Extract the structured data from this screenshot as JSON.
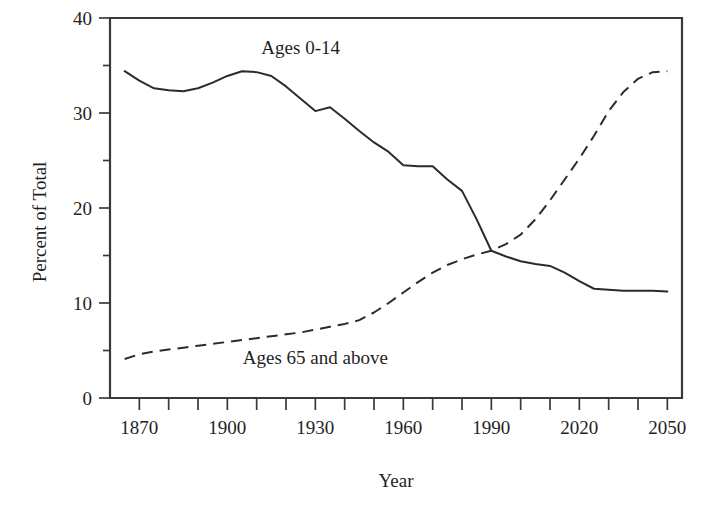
{
  "chart_data": {
    "type": "line",
    "title": "",
    "xlabel": "Year",
    "ylabel": "Percent of Total",
    "xlim": [
      1860,
      2055
    ],
    "ylim": [
      0,
      40
    ],
    "grid": false,
    "legend_position": "inline-annotations",
    "y_tick_labels": [
      "0",
      "10",
      "20",
      "30",
      "40"
    ],
    "y_tick_values": [
      0,
      10,
      20,
      30,
      40
    ],
    "y_minor_tick_values": [
      5,
      15,
      25,
      35
    ],
    "x_tick_labels": [
      "1870",
      "1900",
      "1930",
      "1960",
      "1990",
      "2020",
      "2050"
    ],
    "x_tick_values": [
      1870,
      1900,
      1930,
      1960,
      1990,
      2020,
      2050
    ],
    "x_minor_tick_values": [
      1880,
      1890,
      1910,
      1920,
      1940,
      1950,
      1970,
      1980,
      2000,
      2010,
      2030,
      2040
    ],
    "series": [
      {
        "name": "Ages 0-14",
        "style": "solid",
        "color": "#2b2b2b",
        "annotation": "Ages 0-14",
        "annotation_x": 1925,
        "annotation_y": 36.2,
        "x": [
          1865,
          1870,
          1875,
          1880,
          1885,
          1890,
          1895,
          1900,
          1905,
          1910,
          1915,
          1920,
          1925,
          1930,
          1935,
          1940,
          1945,
          1950,
          1955,
          1960,
          1965,
          1970,
          1975,
          1980,
          1985,
          1990,
          1995,
          2000,
          2005,
          2010,
          2015,
          2020,
          2025,
          2030,
          2035,
          2040,
          2045,
          2050
        ],
        "y": [
          34.4,
          33.4,
          32.6,
          32.4,
          32.3,
          32.6,
          33.2,
          33.9,
          34.4,
          34.3,
          33.9,
          32.8,
          31.5,
          30.2,
          30.6,
          29.4,
          28.1,
          26.9,
          25.9,
          24.5,
          24.4,
          24.4,
          23.0,
          21.8,
          18.8,
          15.5,
          14.9,
          14.4,
          14.1,
          13.9,
          13.2,
          12.3,
          11.5,
          11.4,
          11.3,
          11.3,
          11.3,
          11.2
        ]
      },
      {
        "name": "Ages 65 and above",
        "style": "dashed",
        "color": "#2b2b2b",
        "annotation": "Ages 65 and above",
        "annotation_x": 1930,
        "annotation_y": 3.6,
        "x": [
          1865,
          1870,
          1875,
          1880,
          1885,
          1890,
          1895,
          1900,
          1905,
          1910,
          1915,
          1920,
          1925,
          1930,
          1935,
          1940,
          1945,
          1950,
          1955,
          1960,
          1965,
          1970,
          1975,
          1980,
          1985,
          1990,
          1995,
          2000,
          2005,
          2010,
          2015,
          2020,
          2025,
          2030,
          2035,
          2040,
          2045,
          2050
        ],
        "y": [
          4.1,
          4.6,
          4.9,
          5.1,
          5.3,
          5.5,
          5.7,
          5.9,
          6.1,
          6.3,
          6.5,
          6.7,
          6.9,
          7.2,
          7.5,
          7.8,
          8.2,
          9.0,
          10.0,
          11.1,
          12.2,
          13.2,
          14.0,
          14.6,
          15.1,
          15.5,
          16.2,
          17.2,
          18.8,
          20.8,
          23.0,
          25.2,
          27.6,
          30.2,
          32.2,
          33.6,
          34.3,
          34.4
        ]
      }
    ]
  },
  "axes": {
    "x_axis_title": "Year",
    "y_axis_title": "Percent of Total"
  }
}
